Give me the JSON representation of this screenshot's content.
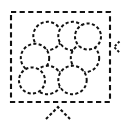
{
  "diagram": {
    "canvas": {
      "width": 124,
      "height": 123,
      "background_color": "#ffffff"
    },
    "stroke_color": "#111111",
    "fill_color": "#ffffff",
    "frame": {
      "name": "boundary-square",
      "x": 11,
      "y": 12,
      "width": 99,
      "height": 90,
      "stroke_width": 2.1,
      "dash": "5.2 3.4",
      "style": "dashed"
    },
    "cluster": {
      "name": "hexagonal-close-packing",
      "packing": "hexagonal",
      "circle_count": 9,
      "radius": 14.2,
      "center_x": 60,
      "center_y": 58,
      "circles": [
        {
          "label": "center",
          "cx": 60.0,
          "cy": 58.0,
          "r": 14.2
        },
        {
          "label": "ring-top-left",
          "cx": 47.5,
          "cy": 36.0,
          "r": 14.2
        },
        {
          "label": "ring-top-right",
          "cx": 72.5,
          "cy": 36.0,
          "r": 14.2
        },
        {
          "label": "ring-left",
          "cx": 35.0,
          "cy": 58.0,
          "r": 14.2
        },
        {
          "label": "ring-right",
          "cx": 85.0,
          "cy": 58.0,
          "r": 14.2
        },
        {
          "label": "ring-bottom-left",
          "cx": 47.5,
          "cy": 80.0,
          "r": 14.2
        },
        {
          "label": "ring-bottom-right",
          "cx": 72.5,
          "cy": 80.0,
          "r": 14.2
        },
        {
          "label": "outer-upper-right",
          "cx": 88.0,
          "cy": 36.5,
          "r": 13.0
        },
        {
          "label": "outer-lower-left",
          "cx": 32.0,
          "cy": 80.5,
          "r": 13.0
        }
      ]
    },
    "markers": [
      {
        "name": "right-edge-arrowhead",
        "icon": "chevron-left-icon",
        "direction": "left",
        "tip_x": 114,
        "tip_y": 47,
        "size": 5.5,
        "style": "dashed"
      },
      {
        "name": "bottom-arrowhead",
        "icon": "chevron-up-icon",
        "direction": "up",
        "tip_x": 58,
        "tip_y": 107,
        "size": 12,
        "style": "dashed"
      }
    ]
  }
}
